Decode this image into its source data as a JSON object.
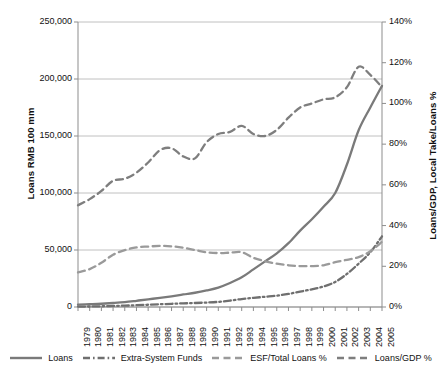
{
  "chart_data": {
    "type": "line",
    "title": "",
    "xlabel": "",
    "ylabel": "Loans RMB 100 mm",
    "y2label": "Loans/GDP, Local Take/Loans %",
    "grid": true,
    "legend_position": "bottom",
    "x": [
      1979,
      1980,
      1981,
      1982,
      1983,
      1984,
      1985,
      1986,
      1987,
      1988,
      1989,
      1990,
      1991,
      1992,
      1993,
      1994,
      1995,
      1996,
      1997,
      1998,
      1999,
      2000,
      2001,
      2002,
      2003,
      2004,
      2005
    ],
    "categories": [
      "1979",
      "1980",
      "1981",
      "1982",
      "1983",
      "1984",
      "1985",
      "1986",
      "1987",
      "1988",
      "1989",
      "1990",
      "1991",
      "1992",
      "1993",
      "1994",
      "1995",
      "1996",
      "1997",
      "1998",
      "1999",
      "2000",
      "2001",
      "2002",
      "2003",
      "2004",
      "2005"
    ],
    "ylim": [
      0,
      250000
    ],
    "yticks": [
      0,
      50000,
      100000,
      150000,
      200000,
      250000
    ],
    "ytick_labels": [
      "0",
      "50,000",
      "100,000",
      "150,000",
      "200,000",
      "250,000"
    ],
    "y2lim": [
      0,
      140
    ],
    "y2ticks": [
      0,
      20,
      40,
      60,
      80,
      100,
      120,
      140
    ],
    "y2tick_labels": [
      "0%",
      "20%",
      "40%",
      "60%",
      "80%",
      "100%",
      "120%",
      "140%"
    ],
    "series": [
      {
        "name": "Loans",
        "axis": "left",
        "style": "solid",
        "color": "#7a7a7a",
        "values": [
          2040,
          2414,
          2860,
          3505,
          4296,
          5469,
          6732,
          8000,
          9400,
          11000,
          12500,
          14500,
          17000,
          21000,
          26000,
          33000,
          40000,
          47000,
          56000,
          67000,
          77000,
          88000,
          100000,
          125000,
          155000,
          175000,
          194000
        ]
      },
      {
        "name": "Extra-System Funds",
        "axis": "left",
        "style": "dashdot",
        "color": "#6f6f6f",
        "values": [
          350,
          450,
          620,
          900,
          1200,
          1600,
          2000,
          2400,
          2800,
          3200,
          3500,
          3900,
          4500,
          5600,
          7000,
          8000,
          9000,
          10000,
          11500,
          13500,
          15500,
          18000,
          22000,
          29000,
          38000,
          48000,
          62000
        ]
      },
      {
        "name": "ESF/Total Loans %",
        "axis": "right",
        "style": "dashed",
        "color": "#9a9a9a",
        "values": [
          17,
          18.6,
          21.7,
          25.7,
          27.9,
          29.3,
          29.7,
          30,
          29.8,
          29.1,
          28,
          26.9,
          26.5,
          26.7,
          26.9,
          24.2,
          22.5,
          21.3,
          20.5,
          20.1,
          20.1,
          20.5,
          22,
          23.2,
          24.5,
          27.4,
          32
        ]
      },
      {
        "name": "Loans/GDP %",
        "axis": "right",
        "style": "dashed",
        "color": "#7e7e7e",
        "values": [
          50,
          53,
          57,
          62,
          63,
          66,
          71,
          77,
          78,
          74,
          73,
          81,
          85,
          86,
          89,
          85,
          84,
          87,
          93,
          98,
          100,
          102,
          103,
          108,
          118,
          114,
          108
        ]
      }
    ]
  },
  "axes": {
    "left_title": "Loans RMB 100 mm",
    "right_title": "Loans/GDP, Local Take/Loans %"
  },
  "legend": {
    "items": [
      {
        "label": "Loans",
        "style": "solid"
      },
      {
        "label": "Extra-System Funds",
        "style": "dashdot"
      },
      {
        "label": "ESF/Total Loans %",
        "style": "dashed"
      },
      {
        "label": "Loans/GDP %",
        "style": "dashed"
      }
    ]
  }
}
